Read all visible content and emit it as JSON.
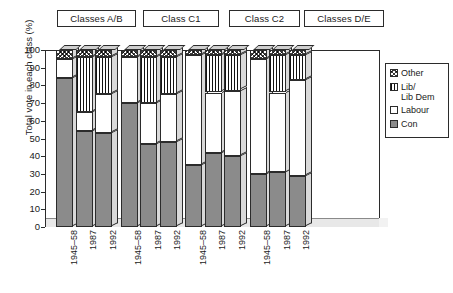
{
  "chart_data": {
    "type": "bar",
    "subtype": "stacked-column-3d",
    "title": "",
    "xlabel": "",
    "ylabel": "Total vote in each class (%)",
    "ylim": [
      0,
      100
    ],
    "yticks": [
      0,
      10,
      20,
      30,
      40,
      50,
      60,
      70,
      80,
      90,
      100
    ],
    "grid": false,
    "legend_position": "right",
    "groups": [
      {
        "label": "Classes A/B",
        "categories": [
          "1945–58",
          "1987",
          "1992"
        ]
      },
      {
        "label": "Class C1",
        "categories": [
          "1945–58",
          "1987",
          "1992"
        ]
      },
      {
        "label": "Class C2",
        "categories": [
          "1945–58",
          "1987",
          "1992"
        ]
      },
      {
        "label": "Classes D/E",
        "categories": [
          "1945–58",
          "1987",
          "1992"
        ]
      }
    ],
    "categories": [
      "1945–58",
      "1987",
      "1992",
      "1945–58",
      "1987",
      "1992",
      "1945–58",
      "1987",
      "1992",
      "1945–58",
      "1987",
      "1992"
    ],
    "series": [
      {
        "name": "Con",
        "color": "#8b8b8b",
        "pattern": "solid-grey",
        "values": [
          84,
          54,
          53,
          70,
          47,
          48,
          35,
          42,
          40,
          30,
          31,
          29
        ]
      },
      {
        "name": "Labour",
        "color": "#ffffff",
        "pattern": "white",
        "values": [
          11,
          11,
          22,
          26,
          23,
          27,
          62,
          34,
          37,
          65,
          45,
          54
        ]
      },
      {
        "name": "Lib/Lib Dem",
        "color": "#ffffff",
        "pattern": "vertical-stripes",
        "values": [
          0,
          31,
          21,
          0,
          26,
          21,
          0,
          21,
          20,
          0,
          21,
          14
        ]
      },
      {
        "name": "Other",
        "color": "#ffffff",
        "pattern": "crosshatch",
        "values": [
          5,
          4,
          4,
          4,
          4,
          4,
          3,
          3,
          3,
          5,
          3,
          3
        ]
      }
    ],
    "legend": [
      {
        "label": "Other",
        "pattern": "crosshatch"
      },
      {
        "label": "Lib/",
        "label2": "Lib Dem",
        "pattern": "vertical-stripes"
      },
      {
        "label": "Labour",
        "pattern": "white"
      },
      {
        "label": "Con",
        "pattern": "solid-grey"
      }
    ]
  }
}
